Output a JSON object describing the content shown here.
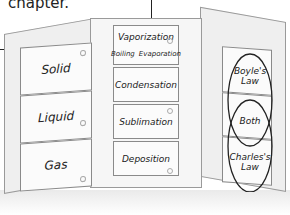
{
  "caption": {
    "text": "chapter."
  },
  "foldable": {
    "left_tabs": [
      "Solid",
      "Liquid",
      "Gas"
    ],
    "middle_tabs": {
      "first": {
        "title": "Vaporization",
        "sub_left": "Boiling",
        "sub_right": "Evaporation"
      },
      "rest": [
        "Condensation",
        "Sublimation",
        "Deposition"
      ]
    },
    "right_venn": {
      "top": "Boyle's Law",
      "middle": "Both",
      "bottom": "Charles's Law"
    }
  }
}
